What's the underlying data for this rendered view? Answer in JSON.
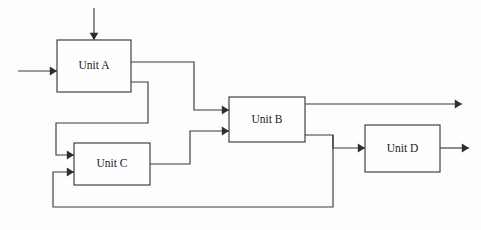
{
  "diagram": {
    "type": "process-flow-block-diagram",
    "canvas": {
      "width": 481,
      "height": 230
    },
    "style": {
      "background_color": "#fdfdfd",
      "line_color": "#3a3a3a",
      "box_fill_color": "#fefefe",
      "text_color": "#1a1a1a"
    },
    "units": [
      {
        "id": "unit-a",
        "label": "Unit A",
        "x": 57,
        "y": 40,
        "width": 74,
        "height": 52
      },
      {
        "id": "unit-b",
        "label": "Unit B",
        "x": 229,
        "y": 97,
        "width": 76,
        "height": 45
      },
      {
        "id": "unit-c",
        "label": "Unit C",
        "x": 74,
        "y": 143,
        "width": 76,
        "height": 42
      },
      {
        "id": "unit-d",
        "label": "Unit D",
        "x": 365,
        "y": 125,
        "width": 75,
        "height": 47
      }
    ],
    "streams": [
      {
        "id": "feed-top-into-unit-a",
        "description": "Top feed stream entering Unit A",
        "points": "94,8 94,40",
        "arrow": {
          "x": 94,
          "y": 40,
          "direction": "down"
        }
      },
      {
        "id": "feed-left-into-unit-a",
        "description": "Left feed stream entering Unit A",
        "points": "18,71 57,71",
        "arrow": {
          "x": 57,
          "y": 71,
          "direction": "right"
        }
      },
      {
        "id": "unit-a-to-unit-b",
        "description": "Unit A upper outlet routed to Unit B upper inlet",
        "points": "131,62 194,62 194,110 229,110",
        "arrow": {
          "x": 229,
          "y": 110,
          "direction": "right"
        }
      },
      {
        "id": "unit-a-to-unit-c",
        "description": "Unit A lower outlet routed down and back to Unit C upper inlet",
        "points": "131,82 148,82 148,123 56,123 56,155 74,155",
        "arrow": {
          "x": 74,
          "y": 155,
          "direction": "right"
        }
      },
      {
        "id": "unit-c-to-unit-b",
        "description": "Unit C outlet routed up to Unit B lower inlet",
        "points": "150,164 190,164 190,131 229,131",
        "arrow": {
          "x": 229,
          "y": 131,
          "direction": "right"
        }
      },
      {
        "id": "unit-b-product-outlet",
        "description": "Unit B upper outlet product stream leaving the diagram",
        "points": "305,104 462,104",
        "arrow": {
          "x": 462,
          "y": 104,
          "direction": "right"
        }
      },
      {
        "id": "unit-b-to-unit-d",
        "description": "Unit B lower outlet routed to Unit D inlet",
        "points": "305,135 333,135 333,148 365,148",
        "arrow": {
          "x": 365,
          "y": 148,
          "direction": "right"
        }
      },
      {
        "id": "recycle-unit-b-to-unit-c",
        "description": "Recycle stream from Unit B lower outlet down around bottom back to Unit C lower inlet",
        "points": "333,135 333,207 53,207 53,172 74,172",
        "arrow": {
          "x": 74,
          "y": 172,
          "direction": "right"
        }
      },
      {
        "id": "unit-d-product-outlet",
        "description": "Unit D outlet product stream leaving the diagram",
        "points": "440,148 469,148",
        "arrow": {
          "x": 469,
          "y": 148,
          "direction": "right"
        }
      }
    ]
  }
}
